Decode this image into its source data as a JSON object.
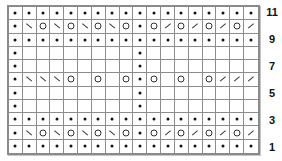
{
  "chart": {
    "columns": 18,
    "rows": 11,
    "legend_symbols": {
      "P": "purl-dot",
      "O": "yarn-over-circle",
      "\\": "ssk-left-slant",
      "/": "k2tog-right-slant",
      ".": "knit-empty"
    },
    "rows_top_to_bottom": [
      {
        "row": 11,
        "cells": [
          "P",
          "P",
          "P",
          "P",
          "P",
          "P",
          "P",
          "P",
          "P",
          "P",
          "P",
          "P",
          "P",
          "P",
          "P",
          "P",
          "P",
          "P"
        ]
      },
      {
        "row": 10,
        "cells": [
          "P",
          "\\",
          "O",
          "\\",
          "O",
          "\\",
          "O",
          "\\",
          "O",
          "P",
          "O",
          "/",
          "O",
          "/",
          "O",
          "/",
          "O",
          "/"
        ]
      },
      {
        "row": 9,
        "cells": [
          "P",
          "P",
          "P",
          "P",
          "P",
          "P",
          "P",
          "P",
          "P",
          "P",
          "P",
          "P",
          "P",
          "P",
          "P",
          "P",
          "P",
          "P"
        ]
      },
      {
        "row": 8,
        "cells": [
          "P",
          ".",
          ".",
          ".",
          ".",
          ".",
          ".",
          ".",
          ".",
          "P",
          ".",
          ".",
          ".",
          ".",
          ".",
          ".",
          ".",
          "."
        ]
      },
      {
        "row": 7,
        "cells": [
          "P",
          ".",
          ".",
          ".",
          ".",
          ".",
          ".",
          ".",
          ".",
          "P",
          ".",
          ".",
          ".",
          ".",
          ".",
          ".",
          ".",
          "."
        ]
      },
      {
        "row": 6,
        "cells": [
          "P",
          "\\",
          "\\",
          "\\",
          "O",
          ".",
          "O",
          ".",
          "O",
          "P",
          "O",
          ".",
          "O",
          ".",
          "O",
          "/",
          "/",
          "/"
        ]
      },
      {
        "row": 5,
        "cells": [
          "P",
          ".",
          ".",
          ".",
          ".",
          ".",
          ".",
          ".",
          ".",
          "P",
          ".",
          ".",
          ".",
          ".",
          ".",
          ".",
          ".",
          "."
        ]
      },
      {
        "row": 4,
        "cells": [
          "P",
          ".",
          ".",
          ".",
          ".",
          ".",
          ".",
          ".",
          ".",
          "P",
          ".",
          ".",
          ".",
          ".",
          ".",
          ".",
          ".",
          "."
        ]
      },
      {
        "row": 3,
        "cells": [
          "P",
          "P",
          "P",
          "P",
          "P",
          "P",
          "P",
          "P",
          "P",
          "P",
          "P",
          "P",
          "P",
          "P",
          "P",
          "P",
          "P",
          "P"
        ]
      },
      {
        "row": 2,
        "cells": [
          "P",
          "\\",
          "O",
          "\\",
          "O",
          "\\",
          "O",
          "\\",
          "O",
          "P",
          "O",
          "/",
          "O",
          "/",
          "O",
          "/",
          "O",
          "/"
        ]
      },
      {
        "row": 1,
        "cells": [
          "P",
          "P",
          "P",
          "P",
          "P",
          "P",
          "P",
          "P",
          "P",
          "P",
          "P",
          "P",
          "P",
          "P",
          "P",
          "P",
          "P",
          "P"
        ]
      }
    ],
    "row_labels": [
      "11",
      "9",
      "7",
      "5",
      "3",
      "1"
    ],
    "colors": {
      "grid_line": "#8c8c8c",
      "frame": "#8a8a8a",
      "symbol": "#111111",
      "background": "#ffffff"
    }
  }
}
